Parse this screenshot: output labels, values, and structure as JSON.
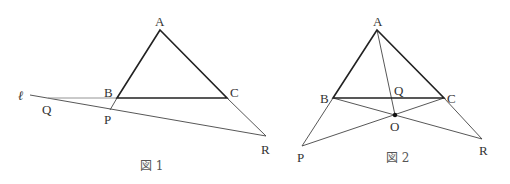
{
  "figures": [
    {
      "caption": "図 1",
      "labels": {
        "A": "A",
        "B": "B",
        "C": "C",
        "P": "P",
        "Q": "Q",
        "R": "R",
        "line": "ℓ"
      }
    },
    {
      "caption": "図 2",
      "labels": {
        "A": "A",
        "B": "B",
        "C": "C",
        "P": "P",
        "Q": "Q",
        "R": "R",
        "O": "O"
      }
    }
  ],
  "colors": {
    "bold_line": "#222222",
    "thin_line": "#444444",
    "text": "#333333"
  }
}
